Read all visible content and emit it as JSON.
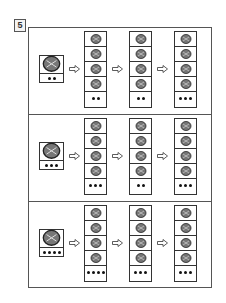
{
  "exercise_number": "5",
  "panels": [
    {
      "start": {
        "icon": "bird-icon",
        "dots": 2
      },
      "columns": [
        {
          "items": [
            "pencil-icon",
            "rabbit-icon",
            "cabbage-icon",
            "pumpkin-icon"
          ],
          "dots": 2
        },
        {
          "items": [
            "lamb-icon",
            "pheasant-icon",
            "necklace-icon",
            "ball-icon"
          ],
          "dots": 2
        },
        {
          "items": [
            "cake-icon",
            "melon-icon",
            "teapot-icon",
            "deer-icon"
          ],
          "dots": 3
        }
      ]
    },
    {
      "start": {
        "icon": "beaver-icon",
        "dots": 3
      },
      "columns": [
        {
          "items": [
            "tomato-icon",
            "wreath-icon",
            "rose-icon",
            "giraffe-icon"
          ],
          "dots": 3
        },
        {
          "items": [
            "cat-icon",
            "berries-icon",
            "wreath-icon",
            "slippers-icon"
          ],
          "dots": 2
        },
        {
          "items": [
            "flower-icon",
            "milk-cartons-icon",
            "wreath-icon",
            "sewing-machine-icon"
          ],
          "dots": 3
        }
      ]
    },
    {
      "start": {
        "icon": "boar-icon",
        "dots": 4
      },
      "columns": [
        {
          "items": [
            "wreath-icon",
            "ant-icon",
            "buffalo-icon",
            "elk-icon"
          ],
          "dots": 4
        },
        {
          "items": [
            "strawberry-icon",
            "basket-icon",
            "squirrel-icon",
            "ball-icon"
          ],
          "dots": 3
        },
        {
          "items": [
            "parrot-icon",
            "tomato-icon",
            "elephant-icon",
            "umbrella-icon"
          ],
          "dots": 3
        }
      ]
    }
  ]
}
